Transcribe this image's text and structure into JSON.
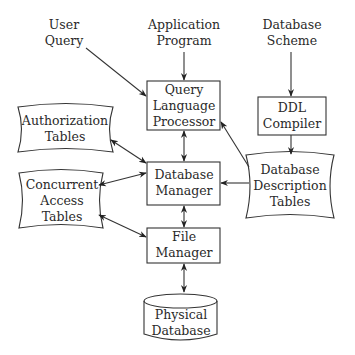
{
  "diagram": {
    "inputs": {
      "user_query": [
        "User",
        "Query"
      ],
      "application_program": [
        "Application",
        "Program"
      ],
      "database_scheme": [
        "Database",
        "Scheme"
      ]
    },
    "boxes": {
      "query_language_processor": [
        "Query",
        "Language",
        "Processor"
      ],
      "database_manager": [
        "Database",
        "Manager"
      ],
      "file_manager": [
        "File",
        "Manager"
      ],
      "ddl_compiler": [
        "DDL",
        "Compiler"
      ]
    },
    "tables": {
      "authorization_tables": [
        "Authorization",
        "Tables"
      ],
      "concurrent_access_tables": [
        "Concurrent",
        "Access",
        "Tables"
      ],
      "database_description_tables": [
        "Database",
        "Description",
        "Tables"
      ]
    },
    "storage": {
      "physical_database": [
        "Physical",
        "Database"
      ]
    },
    "edges": [
      {
        "from": "User Query",
        "to": "Query Language Processor",
        "direction": "one-way"
      },
      {
        "from": "Application Program",
        "to": "Query Language Processor",
        "direction": "one-way"
      },
      {
        "from": "Database Scheme",
        "to": "DDL Compiler",
        "direction": "one-way"
      },
      {
        "from": "DDL Compiler",
        "to": "Database Description Tables",
        "direction": "one-way"
      },
      {
        "from": "Database Description Tables",
        "to": "Query Language Processor",
        "direction": "one-way"
      },
      {
        "from": "Database Description Tables",
        "to": "Database Manager",
        "direction": "one-way"
      },
      {
        "from": "Query Language Processor",
        "to": "Database Manager",
        "direction": "two-way"
      },
      {
        "from": "Authorization Tables",
        "to": "Database Manager",
        "direction": "two-way"
      },
      {
        "from": "Concurrent Access Tables",
        "to": "Database Manager",
        "direction": "two-way"
      },
      {
        "from": "Concurrent Access Tables",
        "to": "File Manager",
        "direction": "two-way"
      },
      {
        "from": "Database Manager",
        "to": "File Manager",
        "direction": "two-way"
      },
      {
        "from": "File Manager",
        "to": "Physical Database",
        "direction": "two-way"
      }
    ],
    "colors": {
      "stroke": "#333333",
      "text": "#2a2a2a",
      "background": "#ffffff"
    }
  }
}
